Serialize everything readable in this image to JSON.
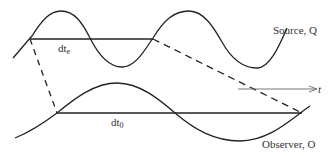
{
  "diagram": {
    "colors": {
      "line": "#222222",
      "axis": "#555555",
      "text": "#333333",
      "background": "#ffffff"
    },
    "source": {
      "label": "Source, Q",
      "interval_label": "dt",
      "interval_subscript": "e"
    },
    "observer": {
      "label": "Observer, O",
      "interval_label": "dt",
      "interval_subscript": "0"
    },
    "axis": {
      "label": "t"
    }
  }
}
